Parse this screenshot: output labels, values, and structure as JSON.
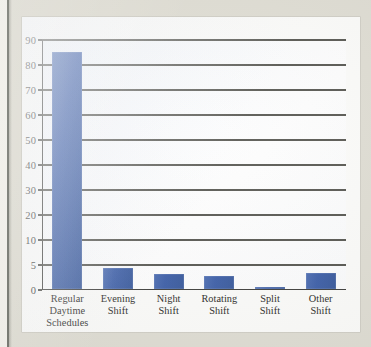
{
  "figure": {
    "background_color": "#dedcd2",
    "card_color": "#fbfbf9",
    "bar_color": "#3a5ca6",
    "grid_color": "#45453f",
    "axis_color": "#3b3b38"
  },
  "chart_data": {
    "type": "bar",
    "title": "",
    "subtitle": "",
    "xlabel": "",
    "ylabel": "",
    "categories": [
      "Regular Daytime Schedules",
      "Evening Shift",
      "Night Shift",
      "Rotating Shift",
      "Split Shift",
      "Other Shift"
    ],
    "category_lines": [
      [
        "Regular Daytime",
        "Schedules"
      ],
      [
        "Evening",
        "Shift"
      ],
      [
        "Night",
        "Shift"
      ],
      [
        "Rotating",
        "Shift"
      ],
      [
        "Split",
        "Shift"
      ],
      [
        "Other",
        "Shift"
      ]
    ],
    "values": [
      84.6,
      4.2,
      3.0,
      2.5,
      0.4,
      3.2
    ],
    "ylim": [
      0,
      90
    ],
    "ytick_labels": [
      "0",
      "5",
      "10",
      "20",
      "30",
      "40",
      "50",
      "60",
      "70",
      "80",
      "90"
    ],
    "ytick_values": [
      0,
      5,
      10,
      20,
      30,
      40,
      50,
      60,
      70,
      80,
      90
    ],
    "grid": true,
    "grid_axis": "y",
    "legend": false,
    "legend_position": "none",
    "series": [
      {
        "name": "Percent of workers",
        "values": [
          84.6,
          4.2,
          3.0,
          2.5,
          0.4,
          3.2
        ]
      }
    ]
  }
}
